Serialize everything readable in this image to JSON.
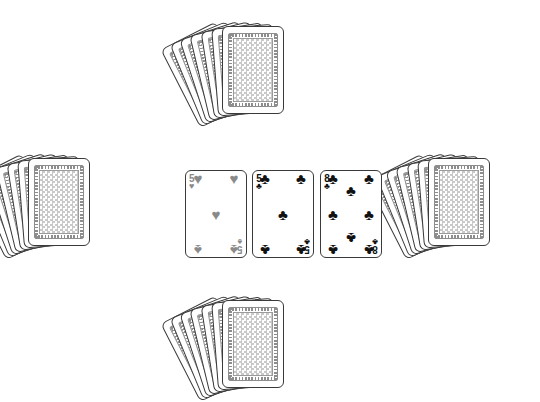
{
  "scene": {
    "name": "card-table",
    "background_color": "#ffffff",
    "width": 540,
    "height": 362
  },
  "card_back": {
    "name": "card-back",
    "frame_color": "#8d8d8d",
    "pattern_color": "#c9c9c9",
    "border_color": "#3a3a3a"
  },
  "hands": [
    {
      "name": "top-hand",
      "position": "top",
      "card_count": 7,
      "face_up": false,
      "origin_x": 222,
      "origin_y": 26,
      "fan_step_deg": 4.5,
      "clipped": false
    },
    {
      "name": "left-hand",
      "position": "left",
      "card_count": 7,
      "face_up": false,
      "origin_x": 28,
      "origin_y": 158,
      "fan_step_deg": 4.5,
      "clipped": false
    },
    {
      "name": "right-hand",
      "position": "right",
      "card_count": 7,
      "face_up": false,
      "origin_x": 428,
      "origin_y": 158,
      "fan_step_deg": 4.5,
      "clipped": false
    },
    {
      "name": "bottom-hand",
      "position": "bottom",
      "card_count": 7,
      "face_up": false,
      "origin_x": 222,
      "origin_y": 300,
      "fan_step_deg": 4.5,
      "clipped": true
    }
  ],
  "table_cards": [
    {
      "name": "table-card-1",
      "rank": "5",
      "suit_top": "hearts",
      "suit_bottom": "spades",
      "suit_symbol_top": "♥",
      "suit_symbol_bottom": "♠",
      "color": "#8a8a8a",
      "x": 185,
      "y": 170,
      "pip_count": 5
    },
    {
      "name": "table-card-2",
      "rank": "5",
      "suit_top": "clubs",
      "suit_bottom": "clubs",
      "suit_symbol_top": "♣",
      "suit_symbol_bottom": "♣",
      "color": "#111111",
      "x": 252,
      "y": 170,
      "pip_count": 5
    },
    {
      "name": "table-card-3",
      "rank": "8",
      "suit_top": "clubs",
      "suit_bottom": "clubs",
      "suit_symbol_top": "♣",
      "suit_symbol_bottom": "♣",
      "color": "#111111",
      "x": 320,
      "y": 170,
      "pip_count": 8
    }
  ],
  "pip_layouts": {
    "5": [
      {
        "x": 0,
        "y": 0,
        "flip": false
      },
      {
        "x": 100,
        "y": 0,
        "flip": false
      },
      {
        "x": 50,
        "y": 50,
        "flip": false
      },
      {
        "x": 0,
        "y": 100,
        "flip": true
      },
      {
        "x": 100,
        "y": 100,
        "flip": true
      }
    ],
    "8": [
      {
        "x": 0,
        "y": 0,
        "flip": false
      },
      {
        "x": 100,
        "y": 0,
        "flip": false
      },
      {
        "x": 50,
        "y": 17,
        "flip": false
      },
      {
        "x": 0,
        "y": 50,
        "flip": false
      },
      {
        "x": 100,
        "y": 50,
        "flip": false
      },
      {
        "x": 50,
        "y": 83,
        "flip": true
      },
      {
        "x": 0,
        "y": 100,
        "flip": true
      },
      {
        "x": 100,
        "y": 100,
        "flip": true
      }
    ]
  }
}
